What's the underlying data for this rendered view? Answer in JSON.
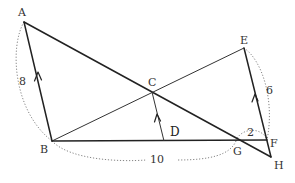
{
  "figure": {
    "points": {
      "A": "A",
      "B": "B",
      "C": "C",
      "D": "D",
      "E": "E",
      "F": "F",
      "G": "G",
      "H": "H"
    },
    "measurements": {
      "AB": "8",
      "BG": "10",
      "EF": "6",
      "GF": "2"
    },
    "segments": [
      {
        "name": "AB",
        "style": "solid",
        "parallel_mark": true
      },
      {
        "name": "AH",
        "style": "solid"
      },
      {
        "name": "BE",
        "style": "thin"
      },
      {
        "name": "BF",
        "style": "solid"
      },
      {
        "name": "CD",
        "style": "thin",
        "parallel_mark": true
      },
      {
        "name": "EH",
        "style": "solid",
        "parallel_mark": true
      }
    ]
  }
}
